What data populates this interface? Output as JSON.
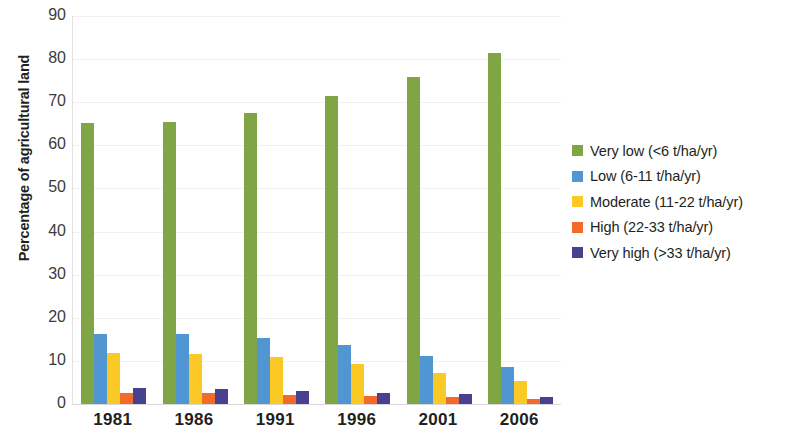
{
  "chart_data": {
    "type": "bar",
    "title": "",
    "xlabel": "",
    "ylabel": "Percentage of agricultural land",
    "ylim": [
      0,
      90
    ],
    "ytick_step": 10,
    "yticks": [
      0,
      10,
      20,
      30,
      40,
      50,
      60,
      70,
      80,
      90
    ],
    "grid": true,
    "legend_position": "right",
    "categories": [
      "1981",
      "1986",
      "1991",
      "1996",
      "2001",
      "2006"
    ],
    "series": [
      {
        "name": "Very low (<6 t/ha/yr)",
        "color": "#7FA544",
        "values": [
          65.3,
          65.5,
          67.5,
          71.5,
          75.8,
          81.5
        ]
      },
      {
        "name": "Low (6-11 t/ha/yr)",
        "color": "#4F96D2",
        "values": [
          16.2,
          16.2,
          15.3,
          13.6,
          11.2,
          8.5
        ]
      },
      {
        "name": "Moderate (11-22 t/ha/yr)",
        "color": "#FBC926",
        "values": [
          11.9,
          11.5,
          10.8,
          9.2,
          7.2,
          5.4
        ]
      },
      {
        "name": "High (22-33 t/ha/yr)",
        "color": "#F26B2A",
        "values": [
          2.5,
          2.5,
          2.2,
          1.9,
          1.6,
          1.2
        ]
      },
      {
        "name": "Very high (>33 t/ha/yr)",
        "color": "#474190",
        "values": [
          3.7,
          3.4,
          3.0,
          2.6,
          2.3,
          1.7
        ]
      }
    ]
  },
  "axis": {
    "y_title": "Percentage of agricultural land"
  },
  "legend": {
    "entries": [
      "Very low (<6 t/ha/yr)",
      "Low (6-11 t/ha/yr)",
      "Moderate (11-22 t/ha/yr)",
      "High (22-33 t/ha/yr)",
      "Very high (>33 t/ha/yr)"
    ]
  }
}
